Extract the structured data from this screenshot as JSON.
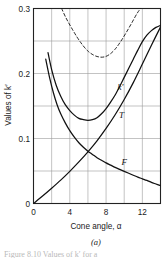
{
  "figure": {
    "caption": "(a)",
    "footnote_partial": "Figure 8.10  Values of k′ for a"
  },
  "chart_data": {
    "type": "line",
    "title": "",
    "subtitle": "",
    "xlabel": "Cone angle, α",
    "ylabel": "Values of k′",
    "xlim": [
      0,
      14
    ],
    "ylim": [
      0,
      0.3
    ],
    "x_ticks": [
      0,
      4,
      8,
      12
    ],
    "x_ticklabels": [
      "0",
      "4",
      "8",
      "12"
    ],
    "x_gridlines": [
      0,
      2,
      4,
      6,
      8,
      10,
      12,
      14
    ],
    "y_ticks": [
      0,
      0.1,
      0.2,
      0.3
    ],
    "y_ticklabels": [
      "0",
      "0.1",
      "0.2",
      "0.3"
    ],
    "y_gridlines": [
      0,
      0.05,
      0.1,
      0.15,
      0.2,
      0.25,
      0.3
    ],
    "grid": true,
    "legend": "inline-curve-labels",
    "legend_position": "inline",
    "line_color": "#111111",
    "grid_color": "#9a9a9a",
    "axis_color": "#222222",
    "background": "#ffffff",
    "series": [
      {
        "name": "k′",
        "label": "k′",
        "style": "solid",
        "label_x": 9.6,
        "label_y": 0.175,
        "points": [
          [
            1.6,
            0.232
          ],
          [
            2.0,
            0.206
          ],
          [
            2.5,
            0.182
          ],
          [
            3.0,
            0.165
          ],
          [
            3.5,
            0.152
          ],
          [
            4.0,
            0.143
          ],
          [
            4.5,
            0.136
          ],
          [
            5.0,
            0.131
          ],
          [
            5.5,
            0.129
          ],
          [
            6.0,
            0.128
          ],
          [
            6.5,
            0.129
          ],
          [
            7.0,
            0.132
          ],
          [
            7.5,
            0.138
          ],
          [
            8.0,
            0.146
          ],
          [
            8.5,
            0.156
          ],
          [
            9.0,
            0.167
          ],
          [
            9.5,
            0.18
          ],
          [
            10.0,
            0.194
          ],
          [
            10.5,
            0.208
          ],
          [
            11.0,
            0.222
          ],
          [
            11.5,
            0.236
          ],
          [
            12.0,
            0.249
          ],
          [
            12.5,
            0.259
          ],
          [
            13.0,
            0.266
          ],
          [
            13.5,
            0.271
          ],
          [
            14.0,
            0.274
          ]
        ]
      },
      {
        "name": "T",
        "label": "T",
        "style": "solid",
        "label_x": 9.7,
        "label_y": 0.131,
        "points": [
          [
            0.0,
            0.0
          ],
          [
            1.0,
            0.0115
          ],
          [
            2.0,
            0.0235
          ],
          [
            3.0,
            0.036
          ],
          [
            4.0,
            0.0495
          ],
          [
            5.0,
            0.064
          ],
          [
            6.0,
            0.0795
          ],
          [
            7.0,
            0.0965
          ],
          [
            8.0,
            0.1155
          ],
          [
            9.0,
            0.1365
          ],
          [
            10.0,
            0.16
          ],
          [
            11.0,
            0.186
          ],
          [
            12.0,
            0.2145
          ],
          [
            13.0,
            0.2435
          ],
          [
            14.0,
            0.2715
          ]
        ]
      },
      {
        "name": "F",
        "label": "F",
        "style": "solid",
        "label_x": 10.0,
        "label_y": 0.0595,
        "points": [
          [
            1.35,
            0.222
          ],
          [
            1.8,
            0.192
          ],
          [
            2.2,
            0.17
          ],
          [
            2.6,
            0.152
          ],
          [
            3.0,
            0.138
          ],
          [
            3.5,
            0.124
          ],
          [
            4.0,
            0.112
          ],
          [
            4.5,
            0.102
          ],
          [
            5.0,
            0.0935
          ],
          [
            5.5,
            0.0865
          ],
          [
            6.0,
            0.0805
          ],
          [
            6.5,
            0.0755
          ],
          [
            7.0,
            0.0705
          ],
          [
            7.5,
            0.0665
          ],
          [
            8.0,
            0.0625
          ],
          [
            8.5,
            0.059
          ],
          [
            9.0,
            0.0555
          ],
          [
            9.5,
            0.0525
          ],
          [
            10.0,
            0.0495
          ],
          [
            10.5,
            0.0465
          ],
          [
            11.0,
            0.0435
          ],
          [
            11.5,
            0.0405
          ],
          [
            12.0,
            0.038
          ],
          [
            12.5,
            0.0355
          ],
          [
            13.0,
            0.0325
          ],
          [
            13.5,
            0.03
          ],
          [
            14.0,
            0.0275
          ]
        ]
      },
      {
        "name": "upper-dashed",
        "label": "",
        "style": "dashed",
        "label_x": null,
        "label_y": null,
        "points": [
          [
            3.1,
            0.3
          ],
          [
            3.6,
            0.285
          ],
          [
            4.2,
            0.27
          ],
          [
            4.8,
            0.256
          ],
          [
            5.4,
            0.244
          ],
          [
            6.0,
            0.2345
          ],
          [
            6.6,
            0.2285
          ],
          [
            7.2,
            0.2255
          ],
          [
            7.8,
            0.2255
          ],
          [
            8.4,
            0.2295
          ],
          [
            9.0,
            0.2375
          ],
          [
            9.6,
            0.249
          ],
          [
            10.2,
            0.2625
          ],
          [
            10.8,
            0.277
          ],
          [
            11.4,
            0.292
          ],
          [
            11.8,
            0.3
          ]
        ]
      }
    ]
  }
}
